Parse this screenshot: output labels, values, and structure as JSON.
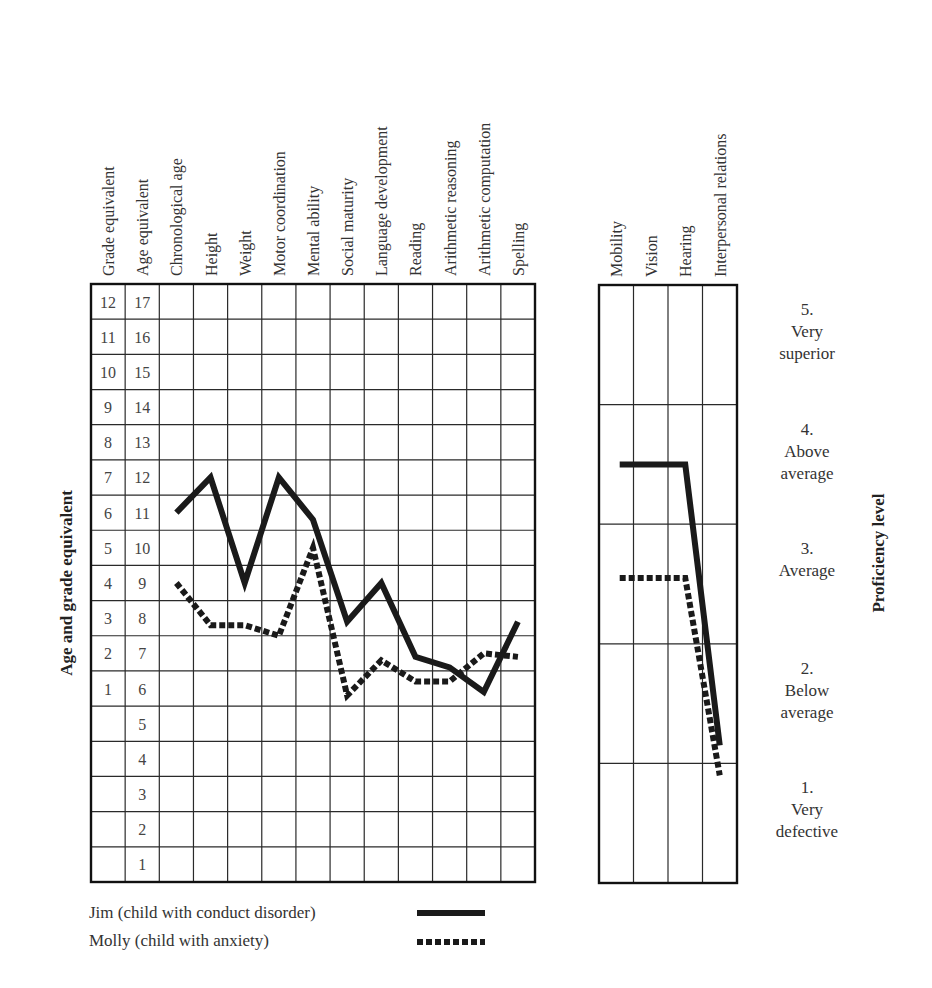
{
  "chart_data": [
    {
      "type": "line",
      "title": "",
      "ylabel": "Age and grade equivalent",
      "xlabel": "",
      "column_headers": [
        "Grade equivalent",
        "Age equivalent",
        "Chronological age",
        "Height",
        "Weight",
        "Motor coordination",
        "Mental ability",
        "Social maturity",
        "Language development",
        "Reading",
        "Arithmetic reasoning",
        "Arithmetic computation",
        "Spelling"
      ],
      "categories": [
        "Chronological age",
        "Height",
        "Weight",
        "Motor coordination",
        "Mental ability",
        "Social maturity",
        "Language development",
        "Reading",
        "Arithmetic reasoning",
        "Arithmetic computation",
        "Spelling"
      ],
      "grade_ticks": [
        "12",
        "11",
        "10",
        "9",
        "8",
        "7",
        "6",
        "5",
        "4",
        "3",
        "2",
        "1",
        "",
        "",
        "",
        "",
        ""
      ],
      "age_ticks": [
        "17",
        "16",
        "15",
        "14",
        "13",
        "12",
        "11",
        "10",
        "9",
        "8",
        "7",
        "6",
        "5",
        "4",
        "3",
        "2",
        "1"
      ],
      "ylim": [
        1,
        17
      ],
      "grid": true,
      "series": [
        {
          "name": "Jim (child with conduct disorder)",
          "style": "solid",
          "values": [
            11.0,
            12.0,
            9.0,
            12.0,
            10.8,
            7.9,
            9.0,
            6.9,
            6.6,
            5.9,
            7.9
          ]
        },
        {
          "name": "Molly (child with anxiety)",
          "style": "dashed",
          "values": [
            9.0,
            7.8,
            7.8,
            7.5,
            10.0,
            5.8,
            6.8,
            6.2,
            6.2,
            7.0,
            6.9
          ]
        }
      ]
    },
    {
      "type": "line",
      "title": "",
      "ylabel": "Proficiency level",
      "categories": [
        "Mobility",
        "Vision",
        "Hearing",
        "Interpersonal relations"
      ],
      "levels": [
        {
          "num": "5.",
          "line1": "Very",
          "line2": "superior"
        },
        {
          "num": "4.",
          "line1": "Above",
          "line2": "average"
        },
        {
          "num": "3.",
          "line1": "Average",
          "line2": ""
        },
        {
          "num": "2.",
          "line1": "Below",
          "line2": "average"
        },
        {
          "num": "1.",
          "line1": "Very",
          "line2": "defective"
        }
      ],
      "ylim": [
        0.5,
        5.5
      ],
      "grid": true,
      "series": [
        {
          "name": "Jim (child with conduct disorder)",
          "style": "solid",
          "values": [
            4.0,
            4.0,
            4.0,
            1.65
          ]
        },
        {
          "name": "Molly (child with anxiety)",
          "style": "dashed",
          "values": [
            3.05,
            3.05,
            3.05,
            1.4
          ]
        }
      ]
    }
  ],
  "legend": [
    {
      "label": "Jim  (child with conduct disorder)",
      "style": "solid"
    },
    {
      "label": "Molly  (child with anxiety)",
      "style": "dashed"
    }
  ],
  "colors": {
    "line": "#1a1a1a",
    "grid": "#2a2a2a",
    "text": "#333333"
  }
}
